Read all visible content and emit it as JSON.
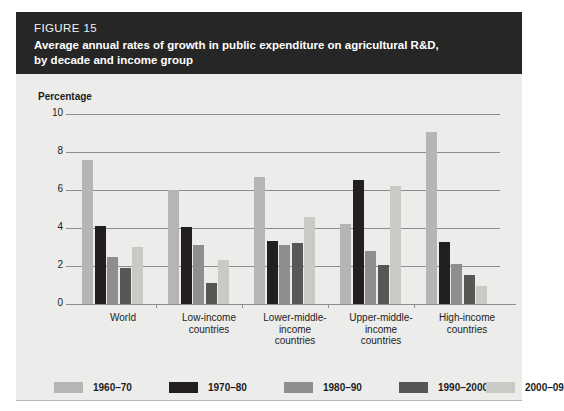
{
  "figure": {
    "number": "FIGURE 15",
    "title_line1": "Average annual rates of growth in public expenditure on agricultural R&D,",
    "title_line2": "by decade and income group",
    "axis_unit_label": "Percentage"
  },
  "chart_data": {
    "type": "bar",
    "title": "Average annual rates of growth in public expenditure on agricultural R&D, by decade and income group",
    "xlabel": "",
    "ylabel": "Percentage",
    "ylim": [
      0,
      10
    ],
    "yticks": [
      0,
      2,
      4,
      6,
      8,
      10
    ],
    "ytick_labels": [
      "0",
      "2",
      "4",
      "6",
      "8",
      "10"
    ],
    "grid": true,
    "legend_position": "bottom",
    "categories": [
      "World",
      "Low-income countries",
      "Lower-middle-income countries",
      "Upper-middle-income countries",
      "High-income countries"
    ],
    "category_lines": [
      [
        "World"
      ],
      [
        "Low-income",
        "countries"
      ],
      [
        "Lower-middle-",
        "income",
        "countries"
      ],
      [
        "Upper-middle-",
        "income",
        "countries"
      ],
      [
        "High-income",
        "countries"
      ]
    ],
    "series": [
      {
        "name": "1960–70",
        "color": "#b5b5b3",
        "values": [
          7.6,
          6.0,
          6.7,
          4.2,
          9.05
        ]
      },
      {
        "name": "1970–80",
        "color": "#231f20",
        "values": [
          4.1,
          4.05,
          3.3,
          6.55,
          3.25
        ]
      },
      {
        "name": "1980–90",
        "color": "#8e8e8c",
        "values": [
          2.45,
          3.1,
          3.1,
          2.8,
          2.1
        ]
      },
      {
        "name": "1990–2000",
        "color": "#575756",
        "values": [
          1.9,
          1.1,
          3.2,
          2.05,
          1.55
        ]
      },
      {
        "name": "2000–09",
        "color": "#c9c9c6",
        "values": [
          3.0,
          2.3,
          4.6,
          6.2,
          0.95
        ]
      }
    ]
  },
  "colors": {
    "header_band": "#262626",
    "card_background": "#ececeb",
    "grid": "#8d8d8d",
    "text": "#1c1c1c"
  }
}
